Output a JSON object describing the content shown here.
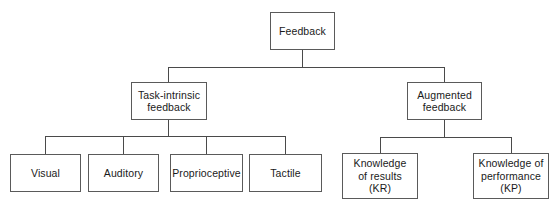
{
  "diagram": {
    "type": "tree",
    "line_color": "#4a4a4a",
    "border_color": "#5a5a5a",
    "text_color": "#1a1a1a",
    "background": "#ffffff",
    "levels": {
      "root": {
        "label": "Feedback"
      },
      "level2": [
        {
          "label": "Task-intrinsic\nfeedback"
        },
        {
          "label": "Augmented\nfeedback"
        }
      ],
      "level3_task_intrinsic": [
        {
          "label": "Visual"
        },
        {
          "label": "Auditory"
        },
        {
          "label": "Proprioceptive"
        },
        {
          "label": "Tactile"
        }
      ],
      "level3_augmented": [
        {
          "label": "Knowledge\nof results\n(KR)"
        },
        {
          "label": "Knowledge of\nperformance\n(KP)"
        }
      ]
    }
  }
}
